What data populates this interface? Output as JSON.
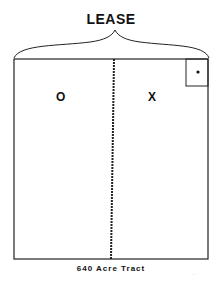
{
  "title": "LEASE",
  "tracts": {
    "left_label": "O",
    "right_label": "X"
  },
  "caption": "640 Acre Tract",
  "reference_code": "· · ·",
  "colors": {
    "line": "#222222",
    "background": "#ffffff"
  }
}
